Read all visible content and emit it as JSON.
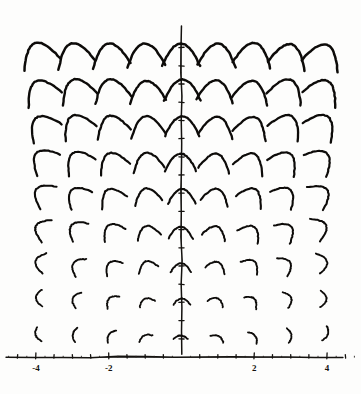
{
  "figure": {
    "title": "",
    "background_color": "#fdfdfc",
    "ink_color": "#0d0b09"
  },
  "chart_data": {
    "type": "line",
    "title": "",
    "subtitle": "",
    "xlabel": "",
    "ylabel": "",
    "grid": false,
    "legend": "none",
    "xlim": [
      -4.6,
      4.6
    ],
    "ylim": [
      0,
      9.2
    ],
    "x_ticks_major": [
      -4,
      -2,
      2,
      4
    ],
    "x_tick_labels": [
      "-4",
      "-2",
      "2",
      "4"
    ],
    "x_ticks_minor": [
      -4.5,
      -3.5,
      -3,
      -2.5,
      -1.5,
      -1,
      -0.5,
      0.5,
      1,
      1.5,
      2.5,
      3,
      3.5,
      4.5
    ],
    "y_ticks_minor": [
      0.5,
      1,
      1.5,
      2,
      2.5,
      3,
      3.5,
      4,
      4.5,
      5,
      5.5,
      6,
      6.5,
      7,
      7.5,
      8,
      8.5
    ],
    "axes_shown": [
      "x-axis",
      "y-axis"
    ],
    "x_axis_pixel_y": 357,
    "y_axis_pixel_x": 181.5,
    "pixels_per_unit_x": 36.4,
    "pixels_per_unit_y": 36.4,
    "grid_columns_x": [
      -4,
      -3,
      -2,
      -1,
      0,
      1,
      2,
      3,
      4
    ],
    "grid_rows_y": [
      8.6,
      7.6,
      6.6,
      5.6,
      4.6,
      3.6,
      2.6,
      1.6,
      0.6
    ],
    "arc_series": [
      {
        "name": "row-1",
        "y": 8.6,
        "arc_half_width": 0.52,
        "arc_height": 0.62,
        "stroke_width": 2.5
      },
      {
        "name": "row-2",
        "y": 7.6,
        "arc_half_width": 0.5,
        "arc_height": 0.58,
        "stroke_width": 2.4
      },
      {
        "name": "row-3",
        "y": 6.6,
        "arc_half_width": 0.47,
        "arc_height": 0.54,
        "stroke_width": 2.3
      },
      {
        "name": "row-4",
        "y": 5.6,
        "arc_half_width": 0.43,
        "arc_height": 0.48,
        "stroke_width": 2.2
      },
      {
        "name": "row-5",
        "y": 4.6,
        "arc_half_width": 0.38,
        "arc_height": 0.41,
        "stroke_width": 2.1
      },
      {
        "name": "row-6",
        "y": 3.6,
        "arc_half_width": 0.33,
        "arc_height": 0.33,
        "stroke_width": 2.0
      },
      {
        "name": "row-7",
        "y": 2.6,
        "arc_half_width": 0.28,
        "arc_height": 0.25,
        "stroke_width": 1.9
      },
      {
        "name": "row-8",
        "y": 1.6,
        "arc_half_width": 0.23,
        "arc_height": 0.17,
        "stroke_width": 1.8
      },
      {
        "name": "row-9",
        "y": 0.6,
        "arc_half_width": 0.2,
        "arc_height": 0.1,
        "stroke_width": 1.8
      }
    ]
  }
}
